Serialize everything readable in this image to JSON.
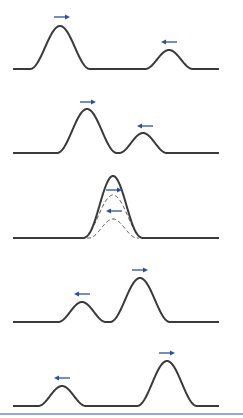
{
  "figure": {
    "title": "Superposition of two wave pulses traveling in opposite directions",
    "colors": {
      "curve": "#3a3a3a",
      "dashed": "#4a4a4a",
      "arrow": "#2a4fa0",
      "bottom_rule": "#6f8fc8",
      "background": "#ffffff"
    },
    "panels": [
      {
        "id": 1,
        "label": "Pulses approaching",
        "baseline_y": 69,
        "pulses": [
          {
            "center_x": 60,
            "height": 43,
            "half_width": 30,
            "direction": "right"
          },
          {
            "center_x": 169,
            "height": 19,
            "half_width": 24,
            "direction": "left"
          }
        ],
        "arrows": [
          {
            "x1": 54,
            "x2": 70,
            "y": 17,
            "direction": "right"
          },
          {
            "x1": 161,
            "x2": 177,
            "y": 42,
            "direction": "left"
          }
        ],
        "show_components": false
      },
      {
        "id": 2,
        "label": "Pulses begin to overlap",
        "baseline_y": 153,
        "pulses": [
          {
            "center_x": 87,
            "height": 44,
            "half_width": 30,
            "direction": "right"
          },
          {
            "center_x": 143,
            "height": 20,
            "half_width": 24,
            "direction": "left"
          }
        ],
        "arrows": [
          {
            "x1": 80,
            "x2": 96,
            "y": 102,
            "direction": "right"
          },
          {
            "x1": 137,
            "x2": 153,
            "y": 126,
            "direction": "left"
          }
        ],
        "show_components": true
      },
      {
        "id": 3,
        "label": "Complete overlap (constructive interference)",
        "baseline_y": 238,
        "pulses": [
          {
            "center_x": 113,
            "height": 43,
            "half_width": 30,
            "direction": "right"
          },
          {
            "center_x": 113,
            "height": 19,
            "half_width": 24,
            "direction": "left"
          }
        ],
        "arrows": [
          {
            "x1": 106,
            "x2": 122,
            "y": 190,
            "direction": "right"
          },
          {
            "x1": 106,
            "x2": 122,
            "y": 211,
            "direction": "left"
          }
        ],
        "show_components": true
      },
      {
        "id": 4,
        "label": "Pulses separating",
        "baseline_y": 322,
        "pulses": [
          {
            "center_x": 140,
            "height": 44,
            "half_width": 30,
            "direction": "right"
          },
          {
            "center_x": 82,
            "height": 20,
            "half_width": 24,
            "direction": "left"
          }
        ],
        "arrows": [
          {
            "x1": 132,
            "x2": 148,
            "y": 270,
            "direction": "right"
          },
          {
            "x1": 74,
            "x2": 90,
            "y": 294,
            "direction": "left"
          }
        ],
        "show_components": true
      },
      {
        "id": 5,
        "label": "Pulses continue unchanged",
        "baseline_y": 406,
        "pulses": [
          {
            "center_x": 167,
            "height": 45,
            "half_width": 30,
            "direction": "right"
          },
          {
            "center_x": 62,
            "height": 20,
            "half_width": 24,
            "direction": "left"
          }
        ],
        "arrows": [
          {
            "x1": 159,
            "x2": 175,
            "y": 353,
            "direction": "right"
          },
          {
            "x1": 54,
            "x2": 70,
            "y": 378,
            "direction": "left"
          }
        ],
        "show_components": false
      }
    ],
    "baseline_x_start": 13,
    "baseline_x_end": 219,
    "bottom_rule_y": 414
  }
}
